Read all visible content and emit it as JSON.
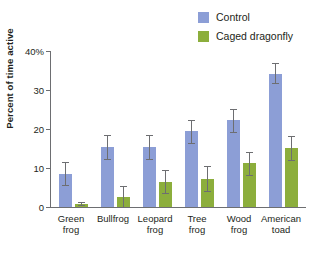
{
  "chart_data": {
    "type": "bar",
    "title": "",
    "xlabel": "",
    "ylabel": "Percent of time active",
    "ylim": [
      0,
      40
    ],
    "yticks": [
      0,
      10,
      20,
      30,
      40
    ],
    "ytick_labels": [
      "0",
      "10",
      "20",
      "30",
      "40%"
    ],
    "grid": false,
    "legend_position": "top-right",
    "categories": [
      "Green frog",
      "Bullfrog",
      "Leopard frog",
      "Tree frog",
      "Wood frog",
      "American toad"
    ],
    "category_lines": [
      [
        "Green",
        "frog"
      ],
      [
        "Bullfrog",
        ""
      ],
      [
        "Leopard",
        "frog"
      ],
      [
        "Tree",
        "frog"
      ],
      [
        "Wood",
        "frog"
      ],
      [
        "American",
        "toad"
      ]
    ],
    "series": [
      {
        "name": "Control",
        "color": "#8c9ed6",
        "values": [
          8.5,
          15.4,
          15.4,
          19.5,
          22.2,
          34.2
        ],
        "err_low": [
          5.6,
          12.4,
          12.4,
          16.4,
          19.3,
          31.8
        ],
        "err_high": [
          11.6,
          18.4,
          18.4,
          22.2,
          25.2,
          37.0
        ]
      },
      {
        "name": "Caged dragonfly",
        "color": "#8cae3c",
        "values": [
          0.8,
          2.6,
          6.4,
          7.2,
          11.3,
          15.1
        ],
        "err_low": [
          0.4,
          0.0,
          3.6,
          4.2,
          8.3,
          12.0
        ],
        "err_high": [
          1.3,
          5.3,
          9.4,
          10.4,
          14.1,
          18.2
        ]
      }
    ],
    "error_bar_note": "vertical capped error bars"
  },
  "legend": {
    "items": [
      {
        "label": "Control",
        "color": "#8c9ed6"
      },
      {
        "label": "Caged dragonfly",
        "color": "#8cae3c"
      }
    ]
  },
  "axes": {
    "y_title": "Percent of time active"
  }
}
